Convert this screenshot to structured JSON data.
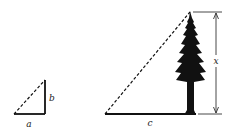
{
  "diagram": {
    "small_triangle": {
      "labels": {
        "base": "a",
        "height": "b"
      }
    },
    "large_triangle": {
      "labels": {
        "base": "c",
        "height": "x"
      }
    },
    "colors": {
      "stroke": "#111111",
      "background": "#ffffff"
    }
  }
}
